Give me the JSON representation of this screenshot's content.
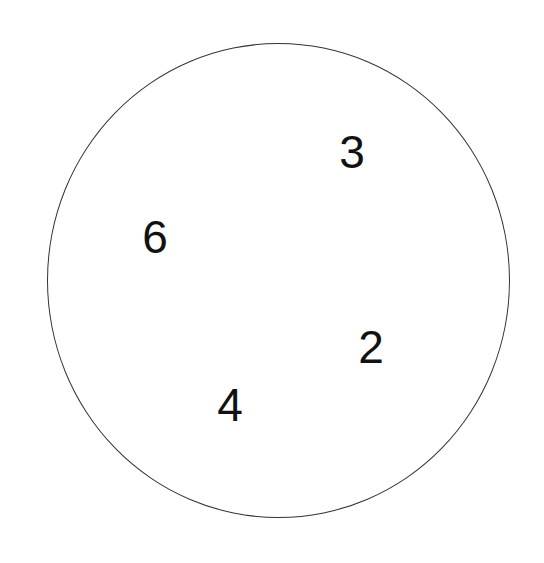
{
  "diagram": {
    "shape": "circle",
    "stroke_color": "#333333",
    "background": "#ffffff",
    "numbers": [
      {
        "value": "3",
        "x": 352,
        "y": 152
      },
      {
        "value": "6",
        "x": 155,
        "y": 237
      },
      {
        "value": "2",
        "x": 371,
        "y": 347
      },
      {
        "value": "4",
        "x": 230,
        "y": 405
      }
    ]
  }
}
